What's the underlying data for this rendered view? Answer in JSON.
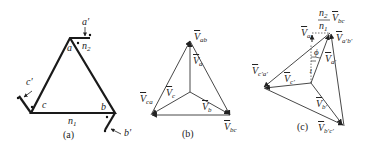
{
  "figure": {
    "panels": [
      {
        "id": "a",
        "caption": "(a)",
        "description": "Delta-connected transformer windings",
        "labels": {
          "a": "a",
          "b": "b",
          "c": "c",
          "a_prime": "a′",
          "b_prime": "b′",
          "c_prime": "c′",
          "n1": "n",
          "n1_sub": "1",
          "n2": "n",
          "n2_sub": "2"
        }
      },
      {
        "id": "b",
        "caption": "(b)",
        "description": "Primary phasor diagram",
        "labels": {
          "V": "V",
          "ab": "ab",
          "a": "a",
          "c": "c",
          "ca": "ca",
          "b": "b",
          "bc": "bc"
        }
      },
      {
        "id": "c",
        "caption": "(c)",
        "description": "Secondary phasor diagram with phase shift",
        "labels": {
          "V": "V",
          "ratio_num": "n",
          "ratio_num_sub": "2",
          "ratio_den": "n",
          "ratio_den_sub": "1",
          "bc": "bc",
          "a": "a",
          "apbp": "a′b′",
          "ap": "a′",
          "cpap": "c′a′",
          "cp": "c′",
          "bp": "b′",
          "bpcp": "b′c′",
          "phi": "ϕ",
          "one": "1"
        }
      }
    ],
    "colors": {
      "line": "#1a1a1a",
      "thin": "#333333"
    }
  }
}
